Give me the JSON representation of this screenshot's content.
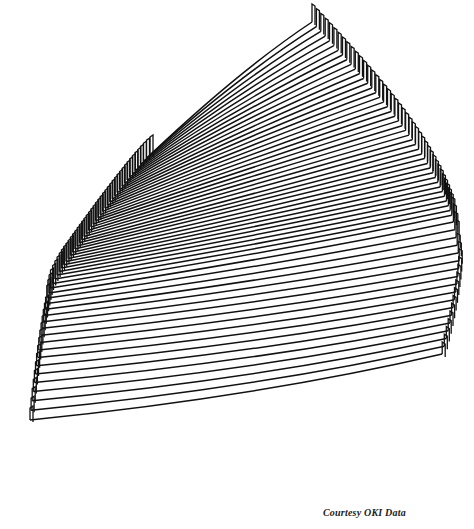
{
  "figure": {
    "line_color": "#111111",
    "background": "#ffffff",
    "num_profiles": 60
  },
  "caption": "Courtesy OKI Data"
}
